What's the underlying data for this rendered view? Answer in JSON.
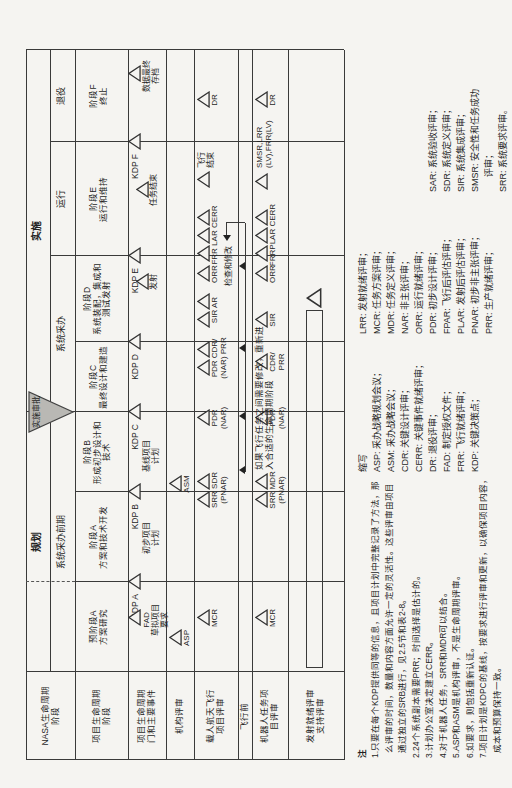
{
  "palette": {
    "bg": "#f5f4f1",
    "line": "#3a3a3a",
    "ink": "#1f1f1f",
    "gray_triangle": "#b9b8b4"
  },
  "row_headers": [
    {
      "id": "nasa",
      "lines": [
        "NASA生命周期",
        "阶段"
      ]
    },
    {
      "id": "project",
      "lines": [
        "项目生命周期",
        "阶段"
      ]
    },
    {
      "id": "gates",
      "lines": [
        "项目生命周期",
        "门和主要事件"
      ]
    },
    {
      "id": "agency",
      "lines": [
        "机构评审"
      ]
    },
    {
      "id": "human",
      "lines": [
        "载人航天飞行",
        "项目评审"
      ]
    },
    {
      "id": "preflight",
      "lines": [
        "飞行前"
      ]
    },
    {
      "id": "robotic",
      "lines": [
        "机器人任务项",
        "目评审"
      ]
    },
    {
      "id": "support",
      "lines": [
        "发射就绪评审",
        "支持评审"
      ]
    }
  ],
  "nasa_row": {
    "formulation": "规划",
    "implementation": "实施",
    "approval_label": "实施审批",
    "sub": [
      {
        "label": "系统采办前期",
        "cx": 226
      },
      {
        "label": "系统采办",
        "cx": 434
      },
      {
        "label": "运行",
        "cx": 569
      },
      {
        "label": "退役",
        "cx": 672
      }
    ]
  },
  "project_phases": [
    {
      "lines": [
        "预阶段A",
        "方案研究"
      ],
      "cx": 141
    },
    {
      "lines": [
        "阶段A",
        "方案和技术开发"
      ],
      "cx": 231
    },
    {
      "lines": [
        "阶段B",
        "形成初步设计和",
        "技术"
      ],
      "cx": 316
    },
    {
      "lines": [
        "阶段C",
        "最终设计和建造"
      ],
      "cx": 391
    },
    {
      "lines": [
        "阶段D",
        "系统装配，集成和",
        "测试发射"
      ],
      "cx": 469
    },
    {
      "lines": [
        "阶段E",
        "运行和维持"
      ],
      "cx": 569
    },
    {
      "lines": [
        "阶段F",
        "终止"
      ],
      "cx": 672
    }
  ],
  "gates": {
    "kdps": [
      {
        "label": "KDP A",
        "x": 186
      },
      {
        "label": "KDP B",
        "x": 276
      },
      {
        "label": "KDP C",
        "x": 356
      },
      {
        "label": "KDP D",
        "x": 426
      },
      {
        "label": "KDP E",
        "x": 512
      },
      {
        "label": "KDP F",
        "x": 626
      }
    ],
    "events": [
      {
        "tris": [
          150
        ],
        "dy": 0,
        "lines": [
          "FAD",
          "草拟项目",
          "要求"
        ],
        "cx": 148
      },
      {
        "tris": [],
        "dy": 0,
        "lines": [
          "",
          "初步项目",
          "计划"
        ],
        "cx": 230
      },
      {
        "tris": [],
        "dy": 0,
        "lines": [
          "",
          "基线项目",
          "计划"
        ],
        "cx": 312
      },
      {
        "tris": [
          486
        ],
        "dy": 8,
        "lines": [
          "发射"
        ],
        "cx": 486
      },
      {
        "tris": [
          578
        ],
        "dy": 8,
        "lines": [
          "任务结束"
        ],
        "cx": 578
      },
      {
        "tris": [
          694
        ],
        "dy": 0,
        "lines": [
          "数据最终",
          "存档"
        ],
        "cx": 692
      }
    ]
  },
  "agency": {
    "events": [
      {
        "tris": [
          130
        ],
        "lines": [
          "ASP"
        ],
        "cx": 130
      },
      {
        "tris": [
          284
        ],
        "lines": [
          "ASM"
        ],
        "cx": 284
      }
    ]
  },
  "human": {
    "events": [
      {
        "tris": [
          150
        ],
        "lines": [
          "MCR"
        ],
        "cx": 150
      },
      {
        "tris": [
          268,
          286
        ],
        "lines": [
          "SRR SDR",
          "(PNAR)"
        ],
        "cx": 278
      },
      {
        "tris": [
          350
        ],
        "lines": [
          "PDR",
          "(NAR)"
        ],
        "cx": 350
      },
      {
        "tris": [
          400,
          418
        ],
        "lines": [
          "PDR CDR/",
          "(NAR) PRR"
        ],
        "cx": 410
      },
      {
        "tris": [
          448,
          466
        ],
        "lines": [
          "SIR AR"
        ],
        "cx": 458
      },
      {
        "tris": [
          494
        ],
        "lines": [
          "ORR"
        ],
        "cx": 494
      },
      {
        "tris": [
          514,
          532,
          550
        ],
        "lines": [
          "FRR LAR CERR"
        ],
        "cx": 533
      },
      {
        "tris": [
          588
        ],
        "lines": [
          "飞行",
          "结束"
        ],
        "cx": 606,
        "side": "right"
      },
      {
        "tris": [
          668
        ],
        "lines": [
          "DR"
        ],
        "cx": 668
      }
    ],
    "inspect_label": "检查和修改",
    "inspect_cx": 502
  },
  "preflight": {
    "loop_note_lines": [
      "如果飞行任务之间需要修改，重新进",
      "入合适的生命周期阶段"
    ],
    "loop": {
      "x1": 296,
      "x2": 545,
      "arrows_up": [
        298,
        352,
        420,
        502
      ]
    }
  },
  "robotic": {
    "events": [
      {
        "tris": [
          150
        ],
        "lines": [
          "MCR"
        ],
        "cx": 150
      },
      {
        "tris": [
          268,
          286
        ],
        "lines": [
          "SRR MDR",
          "(PNAR)"
        ],
        "cx": 278
      },
      {
        "tris": [
          350
        ],
        "lines": [
          "PDR",
          "(NAR)"
        ],
        "cx": 350
      },
      {
        "tris": [
          406
        ],
        "lines": [
          "CDR/",
          "PRR"
        ],
        "cx": 406
      },
      {
        "tris": [
          448
        ],
        "lines": [
          "SIR"
        ],
        "cx": 448
      },
      {
        "tris": [
          494
        ],
        "lines": [
          "ORR"
        ],
        "cx": 494
      },
      {
        "tris": [
          514,
          532,
          550
        ],
        "lines": [
          "FRRPLAR CERR"
        ],
        "cx": 533
      },
      {
        "tris": [
          586
        ],
        "lines": [
          "SMSR,LRR",
          "(LV),FRR(LV)"
        ],
        "cx": 606,
        "side": "right"
      },
      {
        "tris": [
          668
        ],
        "lines": [
          "DR"
        ],
        "cx": 668
      }
    ]
  },
  "support": {
    "bar_x1": 100,
    "bar_x2": 456,
    "tri_x": 470
  },
  "notes": {
    "title": "注",
    "lines": [
      "1.只要在每个KDP提供同等的信息，且项目计划中完整记录了方法，那",
      "  么评审的时间，数量和内容方面允许一定的灵活性。这些评审由项目",
      "  通过独立的SRB进行，见2.5节和表2-8。",
      "2.24个系统副本需要PRR；时间选择是估计的。",
      "3.计划办公室决定建立CERR。",
      "4.对于机器人任务，SRR和MDR可以结合。",
      "5.ASP和ASM是机构评审，不是生命周期评审。",
      "6.如要求，则包括重新认证。",
      "7.项目计划是KDPC的基线，按要求进行评审和更新，以确保项目内容，",
      "  成本和预算保持一致。"
    ]
  },
  "abbr": {
    "title": "缩写",
    "col1": [
      "ASP: 采办战略规划会议；",
      "ASM: 采办战略会议；",
      "CDR: 关键设计评审；",
      "CERR: 关键事件就绪评审；",
      "DR: 退役评审；",
      "FAD: 制定授权文件；",
      "FRR: 飞行就绪评审；",
      "KDP: 关键决策点；"
    ],
    "col2": [
      "LRR: 发射就绪评审；",
      "MCR: 任务方案评审；",
      "MDR: 任务定义评审；",
      "NAR: 非主张评审；",
      "ORR: 运行就绪评审；",
      "PDR: 初步设计评审；",
      "FPAR: 飞行后评估评审；",
      "PLAR: 发射后评估评审；",
      "PNAR: 初步非主张评审；",
      "PRR: 生产就绪评审；"
    ],
    "col3": [
      "SAR: 系统验收评审；",
      "SDR: 系统定义评审；",
      "SIR: 系统集成评审；",
      "SMSR: 安全性和任务成功",
      "      评审；",
      "SRR: 系统要求评审。"
    ]
  }
}
